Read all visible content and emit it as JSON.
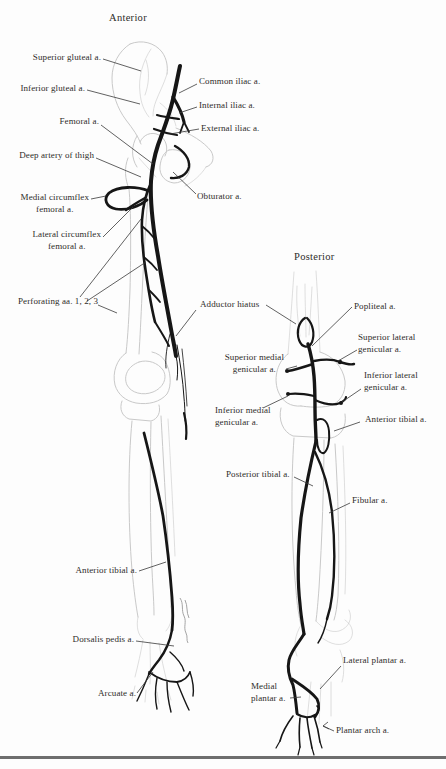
{
  "figure": {
    "anterior": {
      "title": "Anterior",
      "labels": {
        "superior_gluteal": "Superior gluteal a.",
        "inferior_gluteal": "Inferior gluteal a.",
        "femoral": "Femoral a.",
        "deep_artery_of_thigh": "Deep artery of thigh",
        "medial_circumflex_femoral": "Medial circumflex\nfemoral a.",
        "lateral_circumflex_femoral": "Lateral circumflex\nfemoral a.",
        "perforating": "Perforating aa. 1, 2, 3",
        "common_iliac": "Common iliac a.",
        "internal_iliac": "Internal iliac a.",
        "external_iliac": "External iliac a.",
        "obturator": "Obturator a.",
        "adductor_hiatus": "Adductor hiatus",
        "anterior_tibial": "Anterior tibial a.",
        "dorsalis_pedis": "Dorsalis pedis a.",
        "arcuate": "Arcuate a."
      }
    },
    "posterior": {
      "title": "Posterior",
      "labels": {
        "popliteal": "Popliteal a.",
        "superior_lateral_genicular": "Superior lateral\ngenicular a.",
        "superior_medial_genicular": "Superior medial\ngenicular a.",
        "inferior_lateral_genicular": "Inferior lateral\ngenicular a.",
        "inferior_medial_genicular": "Inferior medial\ngenicular a.",
        "anterior_tibial": "Anterior tibial a.",
        "posterior_tibial": "Posterior tibial a.",
        "fibular": "Fibular a.",
        "lateral_plantar": "Lateral plantar a.",
        "medial_plantar": "Medial\nplantar a.",
        "plantar_arch": "Plantar arch a."
      }
    },
    "colors": {
      "artery": "#161616",
      "bone_outline": "#c9c9c9",
      "label_text": "#2e2c2a",
      "bottom_rule": "#6e6e6e"
    }
  }
}
